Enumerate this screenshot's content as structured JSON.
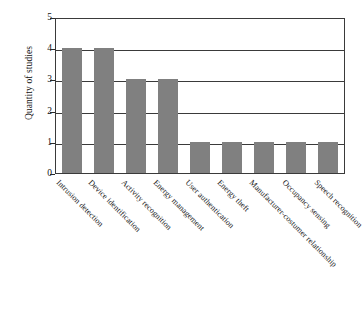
{
  "chart_data": {
    "type": "bar",
    "title": "",
    "xlabel": "",
    "ylabel": "Quantity of studies",
    "categories": [
      "Intrusion detection",
      "Device identification",
      "Activity recognition",
      "Energy management",
      "User authentication",
      "Energy theft",
      "Manufacturer-costumer relationship",
      "Occupancy sensing",
      "Speech recognition"
    ],
    "values": [
      4,
      4,
      3,
      3,
      1,
      1,
      1,
      1,
      1
    ],
    "ylim": [
      0,
      5
    ],
    "yticks": [
      0,
      1,
      2,
      3,
      4,
      5
    ],
    "ytick_labels": [
      "0",
      "1",
      "2",
      "3",
      "4",
      "5"
    ],
    "grid": true,
    "grid_axis": "y",
    "legend": false,
    "legend_position": "none",
    "bar_color": "#808080",
    "axis_color": "#3a3a3a",
    "x_tick_label_rotation": 45
  }
}
